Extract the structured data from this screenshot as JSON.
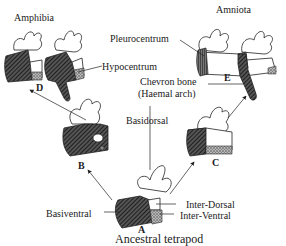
{
  "diagram": {
    "groups": {
      "amphibia": "Amphibia",
      "amniota": "Amniota",
      "ancestor": "Ancestral tetrapod"
    },
    "stages": {
      "A": "A",
      "B": "B",
      "C": "C",
      "D": "D",
      "E": "E"
    },
    "parts": {
      "pleurocentrum": "Pleurocentrum",
      "hypocentrum": "Hypocentrum",
      "chevron_line1": "Chevron bone",
      "chevron_line2": "(Haemal arch)",
      "basidorsal": "Basidorsal",
      "basiventral": "Basiventral",
      "inter_dorsal": "Inter-Dorsal",
      "inter_ventral": "Inter-Ventral"
    },
    "arrows": [
      {
        "from": "A",
        "to": "B"
      },
      {
        "from": "B",
        "to": "D"
      },
      {
        "from": "A",
        "to": "C"
      },
      {
        "from": "C",
        "to": "E"
      }
    ],
    "colors": {
      "ink": "#222222",
      "hatch_dark": "#333333",
      "stipple": "#888888",
      "background": "#ffffff"
    }
  }
}
